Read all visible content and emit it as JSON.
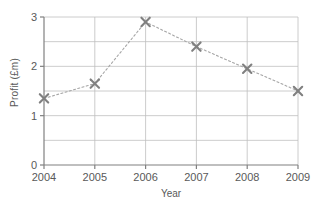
{
  "chart_data": {
    "type": "line",
    "title": "",
    "xlabel": "Year",
    "ylabel": "Profit (£m)",
    "categories": [
      "2004",
      "2005",
      "2006",
      "2007",
      "2008",
      "2009"
    ],
    "x": [
      2004,
      2005,
      2006,
      2007,
      2008,
      2009
    ],
    "values": [
      1.35,
      1.65,
      2.9,
      2.4,
      1.95,
      1.5
    ],
    "series": [
      {
        "name": "Profit",
        "values": [
          1.35,
          1.65,
          2.9,
          2.4,
          1.95,
          1.5
        ],
        "marker": "x-cross",
        "marker_color": "#808080",
        "line_style": "dotted",
        "line_color": "#a6a6a6"
      }
    ],
    "ylim": [
      0,
      3
    ],
    "xlim": [
      2004,
      2009
    ],
    "y_tick_labels": [
      "0",
      "1",
      "2",
      "3"
    ],
    "y_ticks": [
      0,
      1,
      2,
      3
    ],
    "y_minor_ticks": [
      0.5,
      1.5,
      2.5
    ],
    "x_tick_labels": [
      "2004",
      "2005",
      "2006",
      "2007",
      "2008",
      "2009"
    ],
    "grid": true,
    "grid_color": "#bfbfbf",
    "axis_color": "#808080",
    "legend": false,
    "legend_position": "none",
    "background": "#ffffff"
  }
}
